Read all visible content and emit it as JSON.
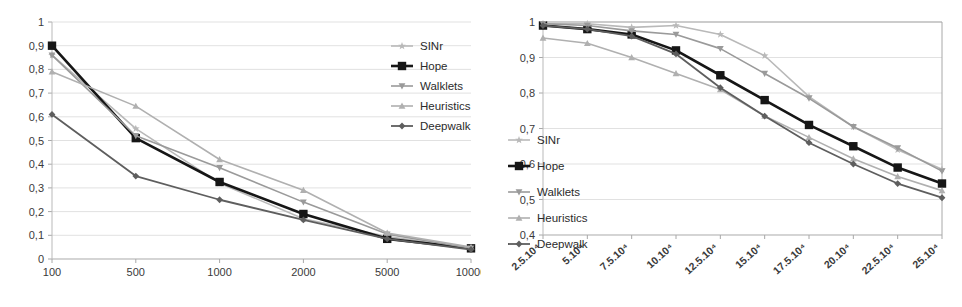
{
  "figure": {
    "title": "",
    "panels": [
      "left-chart",
      "right-chart"
    ]
  },
  "series_styles": {
    "SINr": {
      "color": "#b9b9b9",
      "marker": "star",
      "width": 1.6
    },
    "Hope": {
      "color": "#161616",
      "marker": "square",
      "width": 2.6
    },
    "Walklets": {
      "color": "#9a9a9a",
      "marker": "tri-down",
      "width": 1.6
    },
    "Heuristics": {
      "color": "#b0b0b0",
      "marker": "tri-up",
      "width": 1.6
    },
    "Deepwalk": {
      "color": "#5e5e5e",
      "marker": "diamond",
      "width": 1.8
    }
  },
  "chart_data": [
    {
      "id": "left-chart",
      "type": "line",
      "title": "",
      "subtitle": "",
      "xlabel": "",
      "ylabel": "",
      "x_scale": "category",
      "categories": [
        "100",
        "500",
        "1000",
        "2000",
        "5000",
        "10000"
      ],
      "xticklabels": [
        "100",
        "500",
        "1000",
        "2000",
        "5000",
        "10000"
      ],
      "yticklabels": [
        "0",
        "0,1",
        "0,2",
        "0,3",
        "0,4",
        "0,5",
        "0,6",
        "0,7",
        "0,8",
        "0,9",
        "1"
      ],
      "yticks": [
        0,
        0.1,
        0.2,
        0.3,
        0.4,
        0.5,
        0.6,
        0.7,
        0.8,
        0.9,
        1
      ],
      "ylim": [
        0,
        1
      ],
      "grid": true,
      "legend_position": "top-right",
      "series": [
        {
          "name": "SINr",
          "values": [
            0.86,
            0.55,
            0.32,
            0.17,
            0.095,
            0.045
          ]
        },
        {
          "name": "Hope",
          "values": [
            0.9,
            0.51,
            0.325,
            0.19,
            0.085,
            0.045
          ]
        },
        {
          "name": "Walklets",
          "values": [
            0.86,
            0.52,
            0.385,
            0.24,
            0.105,
            0.045
          ]
        },
        {
          "name": "Heuristics",
          "values": [
            0.79,
            0.645,
            0.42,
            0.29,
            0.11,
            0.05
          ]
        },
        {
          "name": "Deepwalk",
          "values": [
            0.61,
            0.35,
            0.25,
            0.165,
            0.085,
            0.04
          ]
        }
      ]
    },
    {
      "id": "right-chart",
      "type": "line",
      "title": "",
      "subtitle": "",
      "xlabel": "",
      "ylabel": "",
      "x_scale": "category",
      "categories": [
        "2.5.10⁴",
        "5.10⁴",
        "7.5.10⁴",
        "10.10⁴",
        "12.5.10⁴",
        "15.10⁴",
        "17.5.10⁴",
        "20.10⁴",
        "22.5.10⁴",
        "25.10⁴"
      ],
      "xticklabels": [
        "2.5.10⁴",
        "5.10⁴",
        "7.5.10⁴",
        "10.10⁴",
        "12.5.10⁴",
        "15.10⁴",
        "17.5.10⁴",
        "20.10⁴",
        "22.5.10⁴",
        "25.10⁴"
      ],
      "yticklabels": [
        "0,4",
        "0,5",
        "0,6",
        "0,7",
        "0,8",
        "0,9",
        "1"
      ],
      "yticks": [
        0.4,
        0.5,
        0.6,
        0.7,
        0.8,
        0.9,
        1
      ],
      "ylim": [
        0.4,
        1
      ],
      "grid": true,
      "legend_position": "bottom-left",
      "series": [
        {
          "name": "SINr",
          "values": [
            0.995,
            0.995,
            0.985,
            0.99,
            0.965,
            0.905,
            0.79,
            0.705,
            0.64,
            0.585
          ]
        },
        {
          "name": "Hope",
          "values": [
            0.99,
            0.98,
            0.965,
            0.92,
            0.85,
            0.78,
            0.71,
            0.65,
            0.59,
            0.545
          ]
        },
        {
          "name": "Walklets",
          "values": [
            0.995,
            0.99,
            0.975,
            0.965,
            0.925,
            0.855,
            0.785,
            0.705,
            0.645,
            0.58
          ]
        },
        {
          "name": "Heuristics",
          "values": [
            0.955,
            0.94,
            0.9,
            0.855,
            0.81,
            0.735,
            0.675,
            0.615,
            0.565,
            0.525
          ]
        },
        {
          "name": "Deepwalk",
          "values": [
            0.99,
            0.98,
            0.96,
            0.91,
            0.815,
            0.735,
            0.66,
            0.6,
            0.545,
            0.505
          ]
        }
      ]
    }
  ],
  "legends": {
    "left": {
      "items": [
        "SINr",
        "Hope",
        "Walklets",
        "Heuristics",
        "Deepwalk"
      ]
    },
    "right": {
      "items": [
        "SINr",
        "Hope",
        "Walklets",
        "Heuristics",
        "Deepwalk"
      ]
    }
  }
}
